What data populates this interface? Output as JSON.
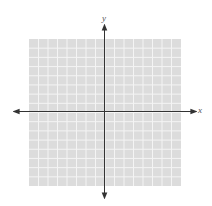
{
  "chart_data": {
    "type": "coordinate-grid",
    "title": "",
    "xlabel": "x",
    "ylabel": "y",
    "grid": true,
    "grid_cells_x": 16,
    "grid_cells_y": 16,
    "xlim": [
      -8,
      8
    ],
    "ylim": [
      -8,
      8
    ],
    "tick_labels": [],
    "series": []
  },
  "labels": {
    "x_axis": "x",
    "y_axis": "y"
  },
  "colors": {
    "grid_fill": "#dcdcdc",
    "grid_line": "#f4f4f4",
    "axis": "#333333"
  }
}
